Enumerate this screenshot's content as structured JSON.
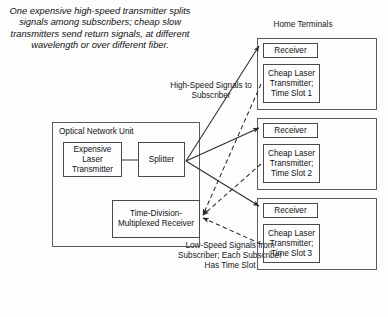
{
  "figure": {
    "caption": "One expensive high-speed transmitter splits signals among subscribers; cheap slow transmitters send return signals, at different wavelength or over different fiber.",
    "home_terminals_label": "Home Terminals",
    "downstream_label": "High-Speed Signals to Subscriber",
    "upstream_label": "Low-Speed Signals from Subscriber; Each Subscriber Has Time Slot"
  },
  "onu": {
    "title": "Optical Network Unit",
    "transmitter": "Expensive Laser Transmitter",
    "splitter": "Splitter",
    "receiver": "Time-Division-Multiplexed Receiver"
  },
  "terminals": [
    {
      "receiver": "Receiver",
      "transmitter": "Cheap Laser Transmitter; Time Slot 1"
    },
    {
      "receiver": "Receiver",
      "transmitter": "Cheap Laser Transmitter; Time Slot 2"
    },
    {
      "receiver": "Receiver",
      "transmitter": "Cheap Laser Transmitter; Time Slot 3"
    }
  ],
  "colors": {
    "stroke": "#5c5c5c",
    "wire": "#2b2b2b",
    "text": "#131313",
    "background": "#fdfdfd"
  }
}
